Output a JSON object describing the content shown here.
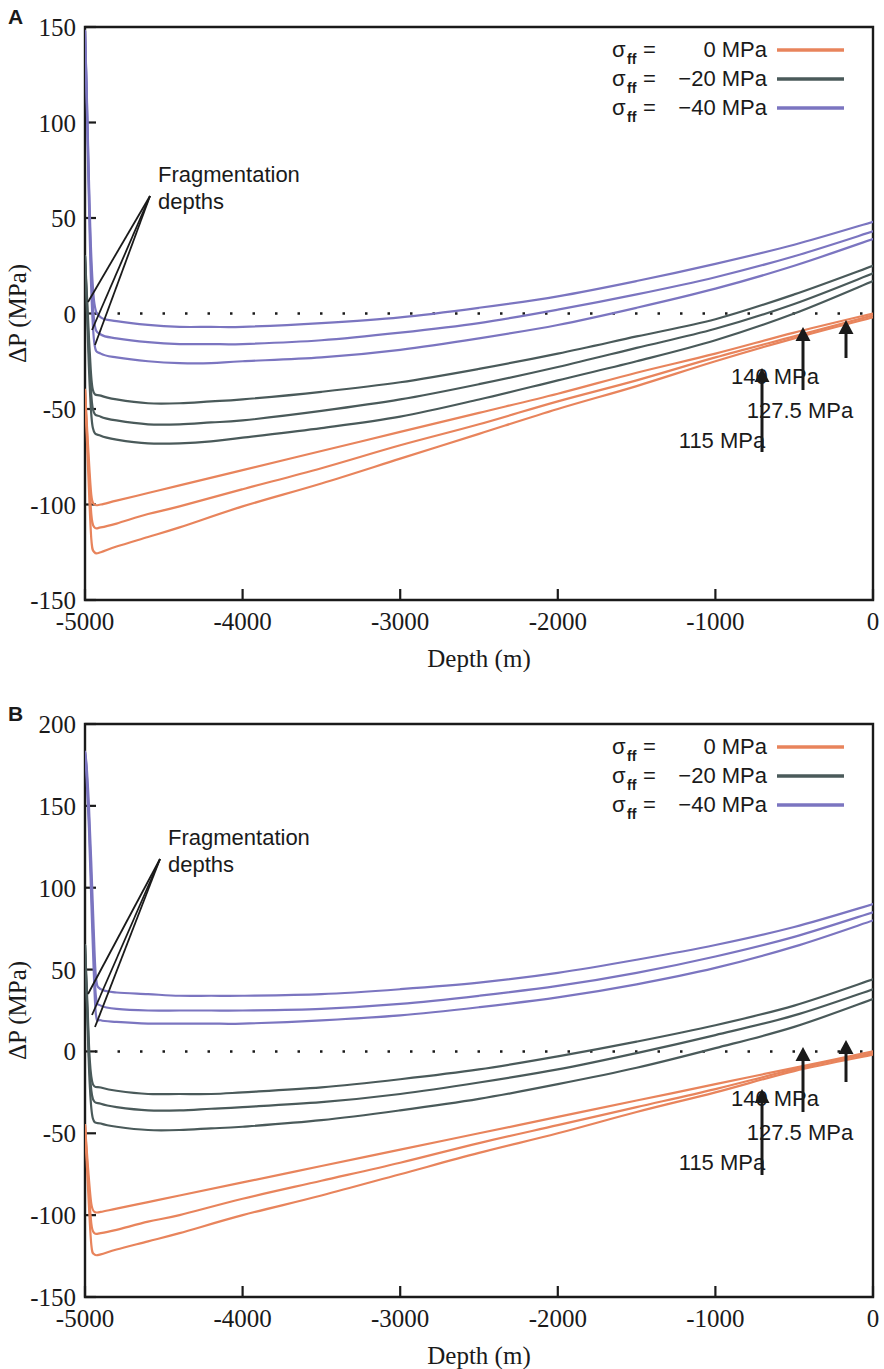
{
  "figure": {
    "panels": [
      {
        "letter": "A",
        "xlabel": "Depth (m)",
        "ylabel": "ΔP (MPa)",
        "xticks": [
          "-5000",
          "-4000",
          "-3000",
          "-2000",
          "-1000",
          "0"
        ],
        "yticks": [
          "150",
          "100",
          "50",
          "0",
          "-50",
          "-100",
          "-150"
        ],
        "annotation": {
          "line1": "Fragmentation",
          "line2": "depths"
        },
        "arrows": [
          {
            "label": "140 MPa"
          },
          {
            "label": "127.5 MPa"
          },
          {
            "label": "115 MPa"
          }
        ]
      },
      {
        "letter": "B",
        "xlabel": "Depth (m)",
        "ylabel": "ΔP (MPa)",
        "xticks": [
          "-5000",
          "-4000",
          "-3000",
          "-2000",
          "-1000",
          "0"
        ],
        "yticks": [
          "200",
          "150",
          "100",
          "50",
          "0",
          "-50",
          "-100",
          "-150"
        ],
        "annotation": {
          "line1": "Fragmentation",
          "line2": "depths"
        },
        "arrows": [
          {
            "label": "140 MPa"
          },
          {
            "label": "127.5 MPa"
          },
          {
            "label": "115 MPa"
          }
        ]
      }
    ],
    "legend": {
      "entries": [
        {
          "symbol": "σ",
          "sub": "ff",
          "eq": "=",
          "value": "0 MPa",
          "color": "#e8845c"
        },
        {
          "symbol": "σ",
          "sub": "ff",
          "eq": "=",
          "value": "−20 MPa",
          "color": "#4a5a5a"
        },
        {
          "symbol": "σ",
          "sub": "ff",
          "eq": "=",
          "value": "−40 MPa",
          "color": "#7b75c0"
        }
      ]
    }
  },
  "chart_data": [
    {
      "type": "line",
      "panel": "A",
      "title": "",
      "xlabel": "Depth (m)",
      "ylabel": "ΔP (MPa)",
      "xlim": [
        -5000,
        0
      ],
      "ylim": [
        -150,
        150
      ],
      "xticks": [
        -5000,
        -4000,
        -3000,
        -2000,
        -1000,
        0
      ],
      "yticks": [
        -150,
        -100,
        -50,
        0,
        50,
        100,
        150
      ],
      "grid": false,
      "legend_position": "top-right",
      "zero_reference_line": 0,
      "annotations": [
        {
          "text": "Fragmentation depths",
          "x": -4350,
          "y": 63
        },
        {
          "text": "140 MPa",
          "x": -620,
          "y": -40
        },
        {
          "text": "127.5 MPa",
          "x": -420,
          "y": -55
        },
        {
          "text": "115 MPa",
          "x": -880,
          "y": -70
        }
      ],
      "series": [
        {
          "name": "σff = 0 MPa, 115 MPa",
          "color": "#e8845c",
          "x": [
            -5000,
            -4980,
            -4960,
            -4940,
            -4900,
            -4800,
            -4600,
            -4400,
            -4000,
            -3500,
            -3000,
            -2500,
            -2000,
            -1500,
            -1000,
            -500,
            0
          ],
          "y": [
            -40,
            -70,
            -95,
            -100,
            -100,
            -98,
            -94,
            -90,
            -82,
            -72,
            -62,
            -52,
            -42,
            -31,
            -21,
            -10,
            0
          ]
        },
        {
          "name": "σff = 0 MPa, 127.5 MPa",
          "color": "#e8845c",
          "x": [
            -5000,
            -4980,
            -4960,
            -4940,
            -4900,
            -4800,
            -4600,
            -4400,
            -4000,
            -3500,
            -3000,
            -2500,
            -2000,
            -1500,
            -1000,
            -500,
            0
          ],
          "y": [
            -40,
            -75,
            -105,
            -112,
            -112,
            -110,
            -105,
            -101,
            -92,
            -81,
            -69,
            -58,
            -46,
            -35,
            -23,
            -12,
            -1
          ]
        },
        {
          "name": "σff = 0 MPa, 140 MPa",
          "color": "#e8845c",
          "x": [
            -5000,
            -4980,
            -4960,
            -4940,
            -4900,
            -4800,
            -4600,
            -4400,
            -4000,
            -3500,
            -3000,
            -2500,
            -2000,
            -1500,
            -1000,
            -500,
            0
          ],
          "y": [
            -40,
            -82,
            -118,
            -125,
            -125,
            -122,
            -117,
            -112,
            -101,
            -89,
            -76,
            -63,
            -50,
            -38,
            -25,
            -13,
            -2
          ]
        },
        {
          "name": "σff = −20 MPa, 115 MPa",
          "color": "#4a5a5a",
          "x": [
            -5000,
            -4985,
            -4970,
            -4950,
            -4900,
            -4800,
            -4600,
            -4400,
            -4200,
            -4000,
            -3500,
            -3000,
            -2500,
            -2000,
            -1500,
            -1000,
            -500,
            0
          ],
          "y": [
            30,
            5,
            -20,
            -40,
            -43,
            -45,
            -47,
            -47,
            -46,
            -45,
            -41,
            -36,
            -29,
            -21,
            -12,
            -3,
            10,
            25
          ]
        },
        {
          "name": "σff = −20 MPa, 127.5 MPa",
          "color": "#4a5a5a",
          "x": [
            -5000,
            -4985,
            -4970,
            -4950,
            -4900,
            -4800,
            -4600,
            -4400,
            -4200,
            -4000,
            -3500,
            -3000,
            -2500,
            -2000,
            -1500,
            -1000,
            -500,
            0
          ],
          "y": [
            30,
            0,
            -28,
            -50,
            -54,
            -56,
            -58,
            -58,
            -57,
            -56,
            -51,
            -45,
            -37,
            -28,
            -18,
            -8,
            5,
            21
          ]
        },
        {
          "name": "σff = −20 MPa, 140 MPa",
          "color": "#4a5a5a",
          "x": [
            -5000,
            -4985,
            -4970,
            -4950,
            -4900,
            -4800,
            -4600,
            -4400,
            -4200,
            -4000,
            -3500,
            -3000,
            -2500,
            -2000,
            -1500,
            -1000,
            -500,
            0
          ],
          "y": [
            30,
            -5,
            -38,
            -60,
            -64,
            -66,
            -68,
            -68,
            -67,
            -65,
            -60,
            -54,
            -45,
            -35,
            -25,
            -14,
            0,
            17
          ]
        },
        {
          "name": "σff = −40 MPa, 115 MPa",
          "color": "#7b75c0",
          "x": [
            -5000,
            -4990,
            -4975,
            -4960,
            -4940,
            -4900,
            -4800,
            -4600,
            -4400,
            -4200,
            -4000,
            -3500,
            -3000,
            -2500,
            -2000,
            -1500,
            -1000,
            -500,
            0
          ],
          "y": [
            148,
            120,
            70,
            30,
            5,
            -2,
            -4,
            -6,
            -7,
            -7,
            -7,
            -5,
            -2,
            3,
            9,
            17,
            26,
            36,
            48
          ]
        },
        {
          "name": "σff = −40 MPa, 127.5 MPa",
          "color": "#7b75c0",
          "x": [
            -5000,
            -4990,
            -4975,
            -4960,
            -4940,
            -4900,
            -4800,
            -4600,
            -4400,
            -4200,
            -4000,
            -3500,
            -3000,
            -2500,
            -2000,
            -1500,
            -1000,
            -500,
            0
          ],
          "y": [
            148,
            118,
            65,
            22,
            -5,
            -11,
            -13,
            -15,
            -16,
            -16,
            -16,
            -14,
            -10,
            -5,
            2,
            10,
            19,
            30,
            43
          ]
        },
        {
          "name": "σff = −40 MPa, 140 MPa",
          "color": "#7b75c0",
          "x": [
            -5000,
            -4990,
            -4975,
            -4960,
            -4940,
            -4900,
            -4800,
            -4600,
            -4400,
            -4200,
            -4000,
            -3500,
            -3000,
            -2500,
            -2000,
            -1500,
            -1000,
            -500,
            0
          ],
          "y": [
            148,
            115,
            58,
            12,
            -16,
            -21,
            -23,
            -25,
            -26,
            -26,
            -25,
            -23,
            -19,
            -13,
            -6,
            3,
            13,
            25,
            39
          ]
        }
      ]
    },
    {
      "type": "line",
      "panel": "B",
      "title": "",
      "xlabel": "Depth (m)",
      "ylabel": "ΔP (MPa)",
      "xlim": [
        -5000,
        0
      ],
      "ylim": [
        -150,
        200
      ],
      "xticks": [
        -5000,
        -4000,
        -3000,
        -2000,
        -1000,
        0
      ],
      "yticks": [
        -150,
        -100,
        -50,
        0,
        50,
        100,
        150,
        200
      ],
      "grid": false,
      "legend_position": "top-right",
      "zero_reference_line": 0,
      "annotations": [
        {
          "text": "Fragmentation depths",
          "x": -4300,
          "y": 113
        },
        {
          "text": "140 MPa",
          "x": -620,
          "y": -40
        },
        {
          "text": "127.5 MPa",
          "x": -420,
          "y": -55
        },
        {
          "text": "115 MPa",
          "x": -880,
          "y": -70
        }
      ],
      "series": [
        {
          "name": "σff = 0 MPa, 115 MPa",
          "color": "#e8845c",
          "x": [
            -5000,
            -4980,
            -4960,
            -4940,
            -4900,
            -4800,
            -4600,
            -4400,
            -4000,
            -3500,
            -3000,
            -2500,
            -2000,
            -1500,
            -1000,
            -500,
            0
          ],
          "y": [
            -45,
            -72,
            -93,
            -98,
            -98,
            -96,
            -92,
            -88,
            -80,
            -70,
            -60,
            -50,
            -40,
            -30,
            -20,
            -10,
            0
          ]
        },
        {
          "name": "σff = 0 MPa, 127.5 MPa",
          "color": "#e8845c",
          "x": [
            -5000,
            -4980,
            -4960,
            -4940,
            -4900,
            -4800,
            -4600,
            -4400,
            -4000,
            -3500,
            -3000,
            -2500,
            -2000,
            -1500,
            -1000,
            -500,
            0
          ],
          "y": [
            -45,
            -78,
            -105,
            -111,
            -111,
            -109,
            -104,
            -100,
            -90,
            -79,
            -68,
            -56,
            -45,
            -34,
            -23,
            -11,
            -1
          ]
        },
        {
          "name": "σff = 0 MPa, 140 MPa",
          "color": "#e8845c",
          "x": [
            -5000,
            -4980,
            -4960,
            -4940,
            -4900,
            -4800,
            -4600,
            -4400,
            -4000,
            -3500,
            -3000,
            -2500,
            -2000,
            -1500,
            -1000,
            -500,
            0
          ],
          "y": [
            -45,
            -85,
            -118,
            -124,
            -124,
            -121,
            -116,
            -111,
            -100,
            -88,
            -75,
            -62,
            -50,
            -37,
            -25,
            -12,
            -2
          ]
        },
        {
          "name": "σff = −20 MPa, 115 MPa",
          "color": "#4a5a5a",
          "x": [
            -5000,
            -4985,
            -4970,
            -4950,
            -4900,
            -4800,
            -4600,
            -4400,
            -4200,
            -4000,
            -3500,
            -3000,
            -2500,
            -2000,
            -1500,
            -1000,
            -500,
            0
          ],
          "y": [
            65,
            30,
            -5,
            -20,
            -22,
            -24,
            -26,
            -26,
            -26,
            -25,
            -22,
            -17,
            -11,
            -3,
            6,
            16,
            28,
            44
          ]
        },
        {
          "name": "σff = −20 MPa, 127.5 MPa",
          "color": "#4a5a5a",
          "x": [
            -5000,
            -4985,
            -4970,
            -4950,
            -4900,
            -4800,
            -4600,
            -4400,
            -4200,
            -4000,
            -3500,
            -3000,
            -2500,
            -2000,
            -1500,
            -1000,
            -500,
            0
          ],
          "y": [
            65,
            25,
            -12,
            -29,
            -32,
            -34,
            -36,
            -36,
            -35,
            -34,
            -31,
            -26,
            -19,
            -11,
            -1,
            10,
            22,
            38
          ]
        },
        {
          "name": "σff = −20 MPa, 140 MPa",
          "color": "#4a5a5a",
          "x": [
            -5000,
            -4985,
            -4970,
            -4950,
            -4900,
            -4800,
            -4600,
            -4400,
            -4200,
            -4000,
            -3500,
            -3000,
            -2500,
            -2000,
            -1500,
            -1000,
            -500,
            0
          ],
          "y": [
            65,
            20,
            -20,
            -41,
            -44,
            -46,
            -48,
            -48,
            -47,
            -46,
            -42,
            -36,
            -29,
            -20,
            -10,
            2,
            15,
            32
          ]
        },
        {
          "name": "σff = −40 MPa, 115 MPa",
          "color": "#7b75c0",
          "x": [
            -5000,
            -4990,
            -4975,
            -4960,
            -4945,
            -4930,
            -4900,
            -4800,
            -4600,
            -4400,
            -4200,
            -4000,
            -3500,
            -3000,
            -2500,
            -2000,
            -1500,
            -1000,
            -500,
            0
          ],
          "y": [
            183,
            175,
            150,
            115,
            75,
            45,
            38,
            36,
            35,
            34,
            34,
            34,
            35,
            38,
            42,
            48,
            56,
            65,
            76,
            90
          ]
        },
        {
          "name": "σff = −40 MPa, 127.5 MPa",
          "color": "#7b75c0",
          "x": [
            -5000,
            -4990,
            -4975,
            -4960,
            -4945,
            -4930,
            -4900,
            -4800,
            -4600,
            -4400,
            -4200,
            -4000,
            -3500,
            -3000,
            -2500,
            -2000,
            -1500,
            -1000,
            -500,
            0
          ],
          "y": [
            183,
            172,
            143,
            103,
            62,
            33,
            28,
            26,
            25,
            25,
            25,
            25,
            26,
            29,
            34,
            40,
            48,
            58,
            70,
            85
          ]
        },
        {
          "name": "σff = −40 MPa, 140 MPa",
          "color": "#7b75c0",
          "x": [
            -5000,
            -4990,
            -4975,
            -4960,
            -4945,
            -4930,
            -4900,
            -4800,
            -4600,
            -4400,
            -4200,
            -4000,
            -3500,
            -3000,
            -2500,
            -2000,
            -1500,
            -1000,
            -500,
            0
          ],
          "y": [
            183,
            168,
            136,
            92,
            50,
            22,
            19,
            18,
            17,
            17,
            17,
            17,
            19,
            22,
            27,
            33,
            41,
            51,
            64,
            80
          ]
        }
      ]
    }
  ]
}
